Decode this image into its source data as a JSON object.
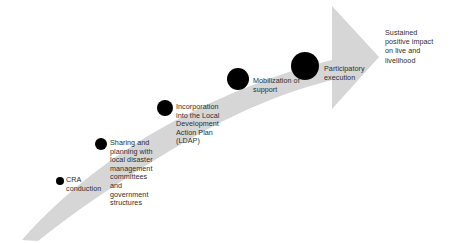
{
  "diagram": {
    "type": "progression-arrow",
    "title": "",
    "arrow": {
      "name": "upward-curved-arrow",
      "color": "#d6d6d6",
      "direction": "left-to-right-ascending"
    },
    "steps": [
      {
        "id": 1,
        "label": "CRA\nconduction",
        "dot": {
          "cx": 60,
          "cy": 181,
          "r": 4.2,
          "color": "#000000"
        },
        "label_x": 66,
        "label_y": 176
      },
      {
        "id": 2,
        "label": "Sharing and\nplanning with\nlocal disaster\nmanagement\ncommittees\nand\ngovernment\nstructures",
        "dot": {
          "cx": 101,
          "cy": 144,
          "r": 6.0,
          "color": "#000000"
        },
        "label_x": 110,
        "label_y": 139
      },
      {
        "id": 3,
        "label": "Incorporation\ninto the Local\nDevelopment\nAction Plan\n(LDAP)",
        "dot": {
          "cx": 165,
          "cy": 108,
          "r": 8.2,
          "color": "#000000"
        },
        "label_x": 176,
        "label_y": 103
      },
      {
        "id": 4,
        "label": "Mobilization of\nsupport",
        "dot": {
          "cx": 238,
          "cy": 79,
          "r": 11.0,
          "color": "#000000"
        },
        "label_x": 253,
        "label_y": 77
      },
      {
        "id": 5,
        "label": "Participatory\nexecution",
        "dot": {
          "cx": 305,
          "cy": 66,
          "r": 14.0,
          "color": "#000000"
        },
        "label_x": 324,
        "label_y": 65
      }
    ],
    "outcome": {
      "label": "Sustained\npositive impact\non live and\nlivelihood",
      "x": 385,
      "y": 28
    }
  }
}
